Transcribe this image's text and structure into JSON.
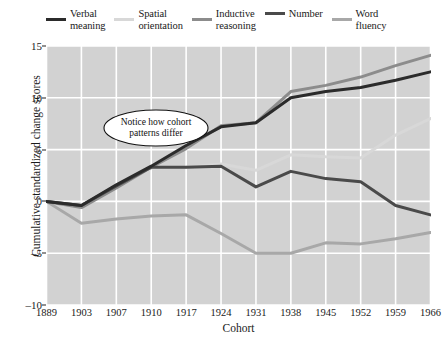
{
  "chart_data": {
    "type": "line",
    "title": "",
    "xlabel": "Cohort",
    "ylabel": "Cumulative standardized change scores",
    "categories": [
      "1889",
      "1903",
      "1907",
      "1910",
      "1917",
      "1924",
      "1931",
      "1938",
      "1945",
      "1952",
      "1959",
      "1966"
    ],
    "xlim": [
      0,
      11
    ],
    "ylim": [
      -10,
      15
    ],
    "yticks": [
      15,
      10,
      5,
      0,
      -5,
      -10
    ],
    "grid": true,
    "legend_position": "top",
    "plot_background": "#d2d2d2",
    "grid_color": "#ffffff",
    "annotations": [
      {
        "text": "Notice how cohort\npatterns differ",
        "shape": "ellipse",
        "x_category": "1903",
        "y_value": 11.0
      }
    ],
    "series": [
      {
        "name": "Verbal\nmeaning",
        "legend_label": "Verbal\nmeaning",
        "color": "#2b2b2b",
        "values": [
          0,
          -0.4,
          1.6,
          3.4,
          5.4,
          7.2,
          7.6,
          10.0,
          10.6,
          11.0,
          11.7,
          12.5
        ]
      },
      {
        "name": "Spatial\norientation",
        "legend_label": "Spatial\norientation",
        "color": "#d8d8d8",
        "values": [
          0,
          -0.4,
          1.4,
          3.2,
          3.3,
          3.6,
          3.0,
          4.5,
          4.3,
          4.2,
          6.4,
          8.0
        ]
      },
      {
        "name": "Inductive\nreasoning",
        "legend_label": "Inductive\nreasoning",
        "color": "#8c8c8c",
        "values": [
          0,
          -0.6,
          1.3,
          3.3,
          5.1,
          7.3,
          7.6,
          10.6,
          11.2,
          12.0,
          13.1,
          14.1
        ]
      },
      {
        "name": "Number",
        "legend_label": "Number",
        "color": "#4a4a4a",
        "values": [
          0,
          -0.4,
          1.5,
          3.3,
          3.3,
          3.4,
          1.4,
          2.9,
          2.2,
          1.9,
          -0.4,
          -1.3
        ]
      },
      {
        "name": "Word\nfluency",
        "legend_label": "Word\nfluency",
        "color": "#a8a8a8",
        "values": [
          0,
          -2.1,
          -1.7,
          -1.4,
          -1.3,
          -3.1,
          -5.0,
          -5.0,
          -4.0,
          -4.1,
          -3.6,
          -3.0
        ]
      }
    ]
  }
}
